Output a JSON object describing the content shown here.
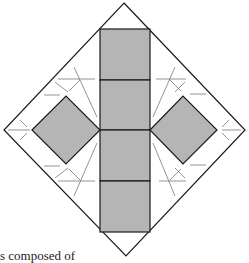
{
  "figure": {
    "fill_color": "#b5b5b5",
    "stroke_color": "#1a1a1a",
    "crease_color": "#555555",
    "column_square_count": 4,
    "side_square_count": 2
  },
  "caption": {
    "text": "s composed of"
  }
}
